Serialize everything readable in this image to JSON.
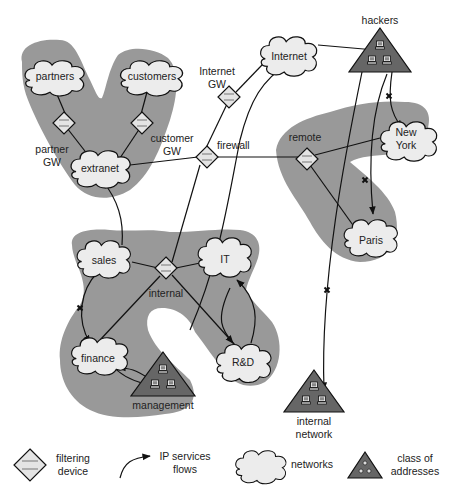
{
  "diagram": {
    "zones": [
      {
        "id": "extranet-zone",
        "contains": [
          "partners",
          "customers",
          "extranet"
        ]
      },
      {
        "id": "remote-zone",
        "contains": [
          "remote",
          "New York",
          "Paris"
        ]
      },
      {
        "id": "internal-zone",
        "contains": [
          "sales",
          "IT",
          "internal",
          "finance",
          "R&D",
          "management"
        ]
      }
    ],
    "networks": {
      "partners": "partners",
      "customers": "customers",
      "extranet": "extranet",
      "internet": "Internet",
      "new_york_1": "New",
      "new_york_2": "York",
      "paris": "Paris",
      "sales": "sales",
      "it": "IT",
      "finance": "finance",
      "rnd": "R&D"
    },
    "filtering_devices": {
      "partner_gw_1": "partner",
      "partner_gw_2": "GW",
      "customer_gw_1": "customer",
      "customer_gw_2": "GW",
      "internet_gw_1": "Internet",
      "internet_gw_2": "GW",
      "firewall": "firewall",
      "remote": "remote",
      "internal": "internal"
    },
    "address_classes": {
      "hackers": "hackers",
      "management": "management",
      "internal_network_1": "internal",
      "internal_network_2": "network"
    }
  },
  "legend": {
    "filtering_device_1": "filtering",
    "filtering_device_2": "device",
    "ip_flows_1": "IP services",
    "ip_flows_2": "flows",
    "networks": "networks",
    "class_1": "class of",
    "class_2": "addresses"
  },
  "colors": {
    "zone": "#999999",
    "cloud_fill": "#ececec",
    "triangle_fill": "#666666",
    "line": "#111111"
  }
}
